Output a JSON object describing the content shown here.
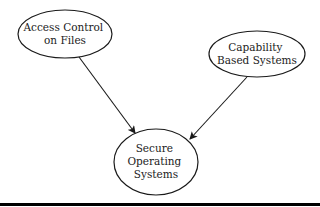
{
  "diagram": {
    "type": "concept-map",
    "nodes": [
      {
        "id": "access",
        "lines": [
          "Access Control",
          "on Files"
        ],
        "cx": 65,
        "cy": 34,
        "rx": 47,
        "ry": 24
      },
      {
        "id": "capability",
        "lines": [
          "Capability",
          "Based Systems"
        ],
        "cx": 257,
        "cy": 54,
        "rx": 48,
        "ry": 23
      },
      {
        "id": "secure",
        "lines": [
          "Secure",
          "Operating",
          "Systems"
        ],
        "cx": 156,
        "cy": 162,
        "rx": 42,
        "ry": 33
      }
    ],
    "edges": [
      {
        "from": "access",
        "to": "secure"
      },
      {
        "from": "capability",
        "to": "secure"
      }
    ],
    "colors": {
      "stroke": "#1a1a1a",
      "text": "#222222",
      "background": "#ffffff",
      "rule": "#000000"
    }
  }
}
